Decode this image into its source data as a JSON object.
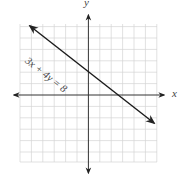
{
  "graph": {
    "x_axis_label": "x",
    "y_axis_label": "y",
    "equation_label": "3x + 4y = 8",
    "grid": {
      "cells_per_side": 6,
      "range": [
        -6,
        6
      ]
    },
    "line": {
      "slope": -0.75,
      "y_intercept": 2,
      "x_intercept": 2.6667
    },
    "colors": {
      "grid": "#cfcfcf",
      "axis": "#222222",
      "line": "#1a1a1a"
    }
  }
}
